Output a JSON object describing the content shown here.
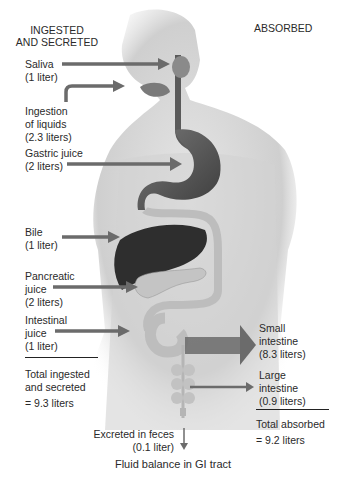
{
  "headers": {
    "left_line1": "INGESTED",
    "left_line2": "AND SECRETED",
    "right": "ABSORBED"
  },
  "ingested": [
    {
      "name": "Saliva",
      "amount": "(1 liter)"
    },
    {
      "name": "Ingestion",
      "name2": "of liquids",
      "amount": "(2.3 liters)"
    },
    {
      "name": "Gastric juice",
      "amount": "(2 liters)"
    },
    {
      "name": "Bile",
      "amount": "(1 liter)"
    },
    {
      "name": "Pancreatic",
      "name2": "juice",
      "amount": "(2 liters)"
    },
    {
      "name": "Intestinal",
      "name2": "juice",
      "amount": "(1 liter)"
    }
  ],
  "total_ingested": {
    "line1": "Total ingested",
    "line2": "and secreted",
    "value": "= 9.3 liters"
  },
  "absorbed": [
    {
      "name": "Small",
      "name2": "intestine",
      "amount": "(8.3 liters)"
    },
    {
      "name": "Large",
      "name2": "intestine",
      "amount": "(0.9 liters)"
    }
  ],
  "total_absorbed": {
    "line1": "Total absorbed",
    "value": "= 9.2 liters"
  },
  "excreted": {
    "line1": "Excreted in feces",
    "line2": "(0.1 liter)"
  },
  "caption": "Fluid balance in GI tract",
  "colors": {
    "arrow": "#6b6b6b",
    "organ": "#555555",
    "skin": "#d9d9d9",
    "liver": "#2e2e2e"
  }
}
